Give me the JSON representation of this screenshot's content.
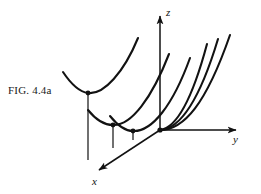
{
  "figure": {
    "caption_prefix": "F",
    "caption_smallcaps": "IG",
    "caption_dot": ". ",
    "caption_number": "4.4a",
    "caption_full": "FIG. 4.4a",
    "ink_color": "#121212",
    "background_color": "#ffffff"
  },
  "axes": {
    "z": {
      "label": "z",
      "origin": [
        160,
        130
      ],
      "tip": [
        160,
        13
      ],
      "arrow": true
    },
    "y": {
      "label": "y",
      "origin": [
        160,
        130
      ],
      "tip": [
        240,
        130
      ],
      "arrow": true
    },
    "x": {
      "label": "x",
      "origin": [
        160,
        130
      ],
      "tip": [
        96,
        172
      ],
      "arrow": true
    }
  },
  "diagram_data": {
    "type": "3d-parabola-family",
    "description": "Family of congruent parabolas opening upward, vertices translated along the x-axis, drawn in an oblique 3D coordinate frame",
    "curve_count": 5,
    "vertex_dots": [
      {
        "id": "v1",
        "x": 88,
        "y": 93
      },
      {
        "id": "v2",
        "x": 113,
        "y": 125
      },
      {
        "id": "v3",
        "x": 133,
        "y": 131
      },
      {
        "id": "v4",
        "x": 160,
        "y": 130
      }
    ],
    "drop_lines": [
      {
        "from": [
          88,
          93
        ],
        "to": [
          88,
          160
        ]
      },
      {
        "from": [
          113,
          125
        ],
        "to": [
          113,
          148
        ]
      },
      {
        "from": [
          133,
          131
        ],
        "to": [
          133,
          140
        ]
      }
    ],
    "curves": [
      {
        "id": "c1",
        "kind": "full-parabola",
        "vertex": [
          88,
          93
        ]
      },
      {
        "id": "c2",
        "kind": "full-parabola",
        "vertex": [
          113,
          125
        ]
      },
      {
        "id": "c3",
        "kind": "full-parabola",
        "vertex": [
          133,
          131
        ]
      },
      {
        "id": "c4",
        "kind": "right-branch",
        "vertex": [
          160,
          130
        ]
      },
      {
        "id": "c5",
        "kind": "right-branch",
        "vertex": [
          160,
          130
        ]
      },
      {
        "id": "c6",
        "kind": "right-branch",
        "vertex": [
          160,
          130
        ]
      }
    ]
  }
}
